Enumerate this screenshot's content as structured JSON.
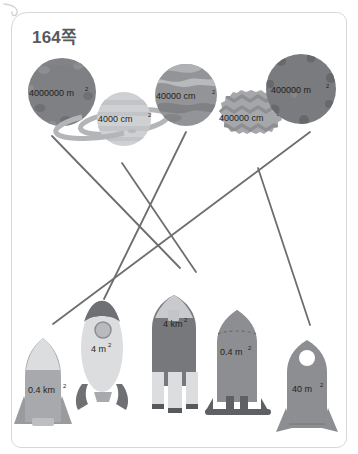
{
  "card": {
    "title": "164쪽",
    "tab_icon": "page-corner-curl-icon",
    "border_color": "#d8d8da",
    "title_color": "#58595b"
  },
  "colors": {
    "line": "#6d6e71",
    "planet_dark_gray": "#7f8083",
    "planet_light_gray": "#cfd0d2",
    "planet_mid_gray": "#9b9c9f",
    "planet_zigzag": "#a6a7aa",
    "planet_crater_dark": "#5d5e61",
    "rocket_light": "#d9dadc",
    "rocket_mid": "#a8a9ac",
    "rocket_dark": "#6f7073",
    "rocket_body_gray": "#828386",
    "text": "#231f20"
  },
  "planets": [
    {
      "id": "planet-1",
      "name": "planet-asteroid-4000000-m2",
      "label": "4000000 m",
      "exponent": "2",
      "value": "4000000 m²",
      "style": "cratered-asteroid",
      "fill": "#7f8083",
      "cx": 62,
      "cy": 92,
      "r": 34
    },
    {
      "id": "planet-2",
      "name": "planet-ringed-4000-cm2",
      "label": "4000 cm",
      "exponent": "2",
      "value": "4000 cm²",
      "style": "ringed-banded",
      "fill": "#cfd0d2",
      "cx": 124,
      "cy": 119,
      "r": 27
    },
    {
      "id": "planet-3",
      "name": "planet-marbled-40000-cm2",
      "label": "40000 cm",
      "exponent": "2",
      "value": "40000 cm²",
      "style": "marbled",
      "fill": "#939497",
      "cx": 186,
      "cy": 95,
      "r": 31
    },
    {
      "id": "planet-4",
      "name": "planet-zigzag-400000-cm2",
      "label": "400000 cm",
      "exponent": "2",
      "value": "400000 cm²",
      "style": "spiky-zigzag",
      "fill": "#a6a7aa",
      "cx": 251,
      "cy": 117,
      "r": 27
    },
    {
      "id": "planet-5",
      "name": "planet-cratered-400000-m2",
      "label": "400000 m",
      "exponent": "2",
      "value": "400000 m²",
      "style": "cratered-dark",
      "fill": "#7a7b7e",
      "cx": 301,
      "cy": 89,
      "r": 35
    }
  ],
  "rockets": [
    {
      "id": "rocket-1",
      "name": "rocket-0-4-km2",
      "label": "0.4 km",
      "exponent": "2",
      "value": "0.4 km²",
      "style": "tall-cone-fins"
    },
    {
      "id": "rocket-2",
      "name": "rocket-4-m2",
      "label": "4 m",
      "exponent": "2",
      "value": "4 m²",
      "style": "capsule-porthole"
    },
    {
      "id": "rocket-3",
      "name": "rocket-4-km2",
      "label": "4 km",
      "exponent": "2",
      "value": "4 km²",
      "style": "wide-three-boosters"
    },
    {
      "id": "rocket-4",
      "name": "rocket-0-4-m2",
      "label": "0.4 m",
      "exponent": "2",
      "value": "0.4 m²",
      "style": "dome-top-legs"
    },
    {
      "id": "rocket-5",
      "name": "rocket-40-m2",
      "label": "40 m",
      "exponent": "2",
      "value": "40 m²",
      "style": "round-window-fins"
    }
  ],
  "connections": [
    {
      "id": "line-1",
      "name": "match-line-1",
      "x1": 52,
      "y1": 136,
      "x2": 180,
      "y2": 268
    },
    {
      "id": "line-2",
      "name": "match-line-2",
      "x1": 122,
      "y1": 163,
      "x2": 196,
      "y2": 272
    },
    {
      "id": "line-3",
      "name": "match-line-3",
      "x1": 186,
      "y1": 132,
      "x2": 104,
      "y2": 299
    },
    {
      "id": "line-4",
      "name": "match-line-4",
      "x1": 258,
      "y1": 168,
      "x2": 310,
      "y2": 325
    },
    {
      "id": "line-5",
      "name": "match-line-5",
      "x1": 310,
      "y1": 132,
      "x2": 53,
      "y2": 324
    }
  ]
}
